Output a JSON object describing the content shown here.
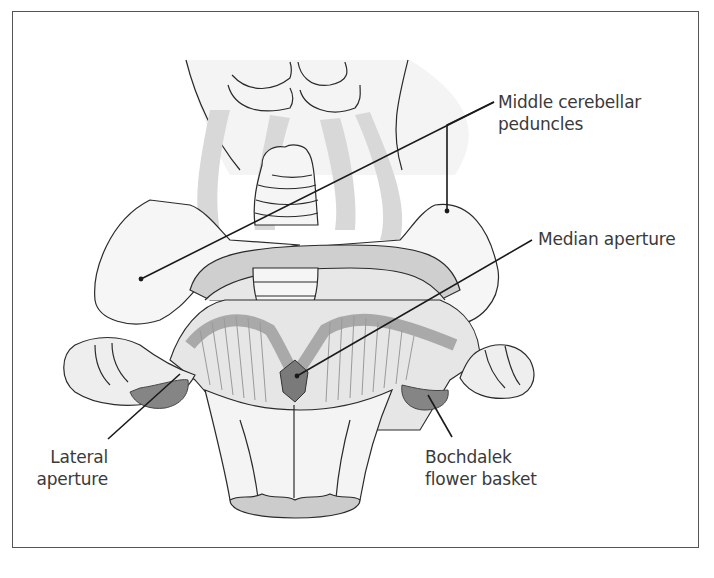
{
  "figure": {
    "colors": {
      "outline": "#2a2a2a",
      "tissue_light": "#f1f1f1",
      "tissue_shade": "#d6d6d6",
      "ventricle_floor": "#a9a9a9",
      "plexus_dark": "#7c7c7c",
      "frame": "#555555",
      "label_text": "#3a3a3a"
    }
  },
  "labels": {
    "middle_cerebellar_peduncles": {
      "line1": "Middle cerebellar",
      "line2": "peduncles"
    },
    "median_aperture": {
      "line1": "Median aperture"
    },
    "lateral_aperture": {
      "line1": "Lateral",
      "line2": "aperture"
    },
    "bochdalek_flower_basket": {
      "line1": "Bochdalek",
      "line2": "flower basket"
    }
  }
}
